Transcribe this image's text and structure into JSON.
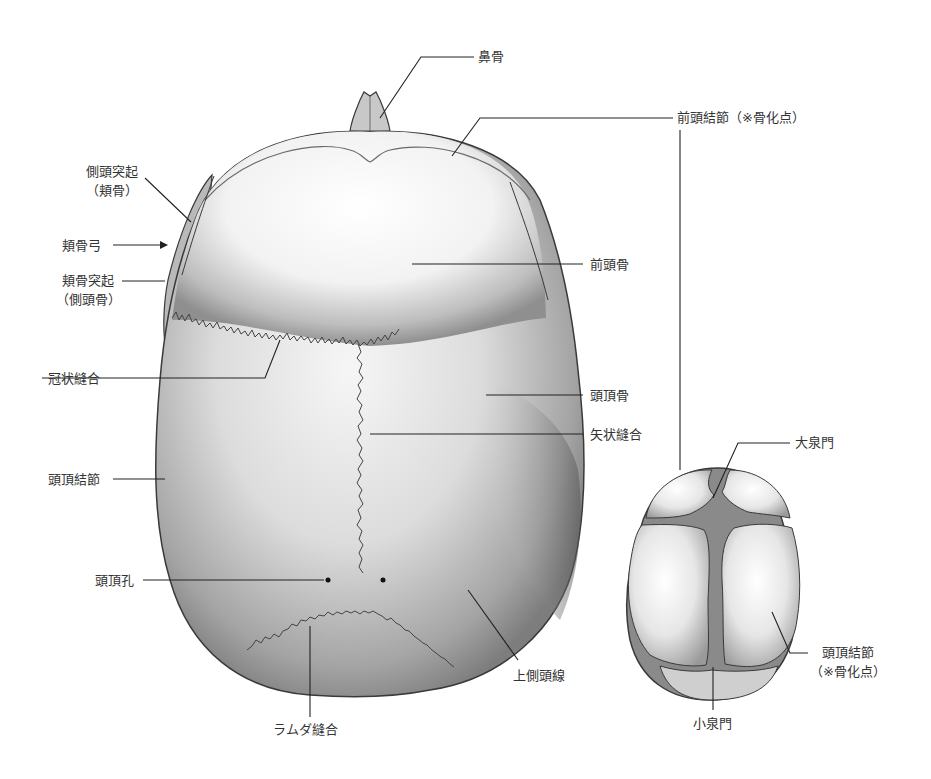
{
  "diagram": {
    "title": "",
    "colors": {
      "bone_light": "#ffffff",
      "bone_shade": "#8a8a8a",
      "outline": "#3a3a3a",
      "fontanelle": "#7f7f7f",
      "leader": "#222222",
      "text": "#333333"
    },
    "adult_skull": {
      "view": "superior",
      "labels": {
        "nasal_bone": "鼻骨",
        "frontal_eminence": "前頭結節（※骨化点）",
        "frontal_process_l1": "側頭突起",
        "frontal_process_l2": "（頬骨）",
        "zygomatic_arch": "頬骨弓",
        "zygomatic_process_l1": "頬骨突起",
        "zygomatic_process_l2": "（側頭骨）",
        "frontal_bone": "前頭骨",
        "coronal_suture": "冠状縫合",
        "parietal_bone": "頭頂骨",
        "sagittal_suture": "矢状縫合",
        "parietal_eminence": "頭頂結節",
        "parietal_foramen": "頭頂孔",
        "superior_temporal_line": "上側頭線",
        "lambdoid_suture": "ラムダ縫合"
      }
    },
    "infant_skull": {
      "view": "superior",
      "labels": {
        "anterior_fontanelle": "大泉門",
        "parietal_eminence_l1": "頭頂結節",
        "parietal_eminence_l2": "（※骨化点）",
        "posterior_fontanelle": "小泉門"
      }
    }
  }
}
